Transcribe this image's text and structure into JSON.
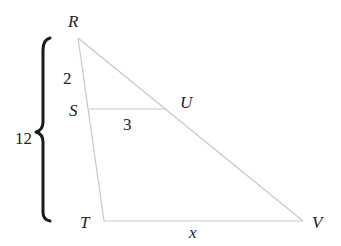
{
  "diagram": {
    "type": "similar-triangles",
    "vertices": {
      "R": {
        "label": "R",
        "x": 78,
        "y": 38,
        "label_x": 68,
        "label_y": 27
      },
      "S": {
        "label": "S",
        "x": 89,
        "y": 109,
        "label_x": 69,
        "label_y": 116
      },
      "U": {
        "label": "U",
        "x": 167,
        "y": 109,
        "label_x": 180,
        "label_y": 108
      },
      "T": {
        "label": "T",
        "x": 104,
        "y": 221,
        "label_x": 80,
        "label_y": 228
      },
      "V": {
        "label": "V",
        "x": 303,
        "y": 221,
        "label_x": 312,
        "label_y": 228
      }
    },
    "segments": [
      {
        "from": "R",
        "to": "T"
      },
      {
        "from": "R",
        "to": "V"
      },
      {
        "from": "T",
        "to": "V"
      },
      {
        "from": "S",
        "to": "U"
      }
    ],
    "measurements": {
      "RS": {
        "text": "2",
        "x": 63,
        "y": 84
      },
      "SU": {
        "text": "3",
        "x": 123,
        "y": 130
      },
      "RT": {
        "text": "12",
        "x": 15,
        "y": 144
      },
      "TV": {
        "text": "x",
        "x": 189,
        "y": 238
      }
    },
    "brace": {
      "spans": "RT",
      "x": 44,
      "top": 38,
      "bottom": 222,
      "tip_x": 36
    },
    "colors": {
      "edge": "#c8c8c8",
      "brace": "#1a1a1a",
      "text": "#222222",
      "background": "#ffffff"
    }
  }
}
